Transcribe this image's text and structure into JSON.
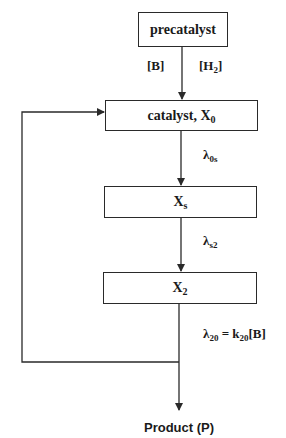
{
  "diagram": {
    "nodes": {
      "precatalyst": {
        "label": "precatalyst"
      },
      "catalyst": {
        "label_main": "catalyst, X",
        "label_sub": "0"
      },
      "xs": {
        "label_main": "X",
        "label_sub": "s"
      },
      "x2": {
        "label_main": "X",
        "label_sub": "2"
      },
      "product": {
        "label": "Product (P)"
      }
    },
    "edges": {
      "precatalyst_to_catalyst": {
        "left_label": "[B]",
        "right_label_main": "[H",
        "right_label_sub": "2",
        "right_label_end": "]"
      },
      "catalyst_to_xs": {
        "lambda": "λ",
        "sub": "0s"
      },
      "xs_to_x2": {
        "lambda": "λ",
        "sub": "s2"
      },
      "x2_to_product": {
        "lambda": "λ",
        "sub": "20",
        "equals": " = k",
        "k_sub": "20",
        "tail": "[B]"
      },
      "feedback": {
        "from": "x2_output",
        "to": "catalyst"
      }
    }
  }
}
